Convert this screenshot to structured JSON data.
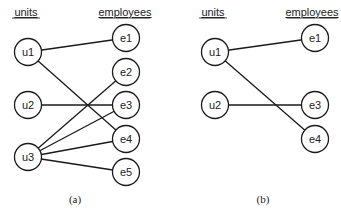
{
  "panels": [
    {
      "id": "a",
      "caption": "(a)",
      "caption_pos": [
        75,
        203
      ],
      "headers": {
        "left": {
          "label": "units",
          "x": 26,
          "y": 16
        },
        "right": {
          "label": "employees",
          "x": 125,
          "y": 16
        }
      },
      "nodes": [
        {
          "id": "u1",
          "label": "u1",
          "x": 28,
          "y": 52
        },
        {
          "id": "u2",
          "label": "u2",
          "x": 28,
          "y": 105
        },
        {
          "id": "u3",
          "label": "u3",
          "x": 28,
          "y": 157
        },
        {
          "id": "e1",
          "label": "e1",
          "x": 126,
          "y": 38
        },
        {
          "id": "e2",
          "label": "e2",
          "x": 126,
          "y": 72
        },
        {
          "id": "e3",
          "label": "e3",
          "x": 126,
          "y": 105
        },
        {
          "id": "e4",
          "label": "e4",
          "x": 126,
          "y": 139
        },
        {
          "id": "e5",
          "label": "e5",
          "x": 126,
          "y": 172
        }
      ],
      "edges": [
        [
          "u1",
          "e1"
        ],
        [
          "u1",
          "e4"
        ],
        [
          "u2",
          "e3"
        ],
        [
          "u3",
          "e2"
        ],
        [
          "u3",
          "e3"
        ],
        [
          "u3",
          "e4"
        ],
        [
          "u3",
          "e5"
        ]
      ]
    },
    {
      "id": "b",
      "caption": "(b)",
      "caption_pos": [
        263,
        203
      ],
      "headers": {
        "left": {
          "label": "units",
          "x": 213,
          "y": 16
        },
        "right": {
          "label": "employees",
          "x": 312,
          "y": 16
        }
      },
      "nodes": [
        {
          "id": "u1",
          "label": "u1",
          "x": 215,
          "y": 52
        },
        {
          "id": "u2",
          "label": "u2",
          "x": 215,
          "y": 105
        },
        {
          "id": "e1",
          "label": "e1",
          "x": 315,
          "y": 38
        },
        {
          "id": "e3",
          "label": "e3",
          "x": 315,
          "y": 105
        },
        {
          "id": "e4",
          "label": "e4",
          "x": 315,
          "y": 139
        }
      ],
      "edges": [
        [
          "u1",
          "e1"
        ],
        [
          "u1",
          "e4"
        ],
        [
          "u2",
          "e3"
        ]
      ]
    }
  ],
  "node_radius": 13.5
}
